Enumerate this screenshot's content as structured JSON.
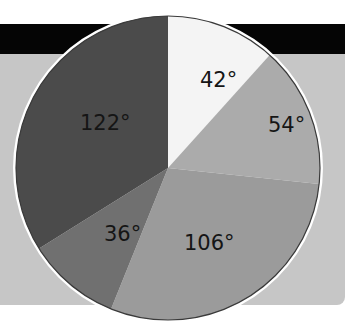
{
  "chart_data": {
    "type": "pie",
    "title": "",
    "unit": "degrees",
    "start_angle": "12 o'clock",
    "direction": "clockwise",
    "categories": [
      "A",
      "B",
      "C",
      "D",
      "E"
    ],
    "values": [
      42,
      54,
      106,
      36,
      122
    ],
    "labels": [
      "42°",
      "54°",
      "106°",
      "36°",
      "122°"
    ],
    "colors": [
      "#f4f4f4",
      "#ababab",
      "#9b9b9b",
      "#707070",
      "#4b4b4b"
    ],
    "legend": "none"
  },
  "background": {
    "band_color": "#050505",
    "panel_color": "#c6c6c6"
  }
}
